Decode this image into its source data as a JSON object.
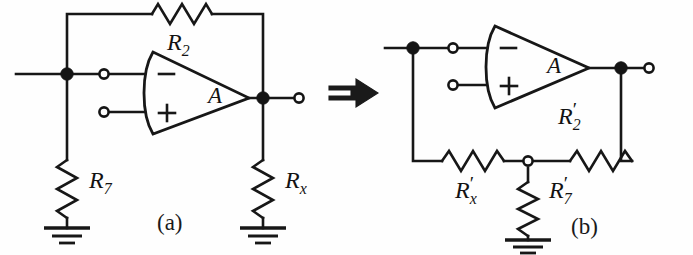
{
  "figure": {
    "caption_a": "(a)",
    "caption_b": "(b)",
    "transform_arrow": "double-right-arrow"
  },
  "circuit_a": {
    "name": "inverting-amplifier-with-rx-to-ground",
    "opamp": {
      "gain_label": "A",
      "inverting_input_symbol": "−",
      "noninverting_input_symbol": "+"
    },
    "components": [
      {
        "id": "R2",
        "base": "R",
        "subscript": "2",
        "prime": "",
        "orientation": "horizontal",
        "label": "R2"
      },
      {
        "id": "R7",
        "base": "R",
        "subscript": "7",
        "prime": "",
        "orientation": "vertical",
        "label": "R7"
      },
      {
        "id": "Rx",
        "base": "R",
        "subscript": "x",
        "prime": "",
        "orientation": "vertical",
        "label": "Rx"
      }
    ],
    "nodes": [
      {
        "id": "input-node",
        "type": "filled"
      },
      {
        "id": "output-node",
        "type": "filled"
      },
      {
        "id": "inverting-terminal",
        "type": "open"
      },
      {
        "id": "noninverting-terminal",
        "type": "open"
      },
      {
        "id": "output-terminal",
        "type": "open"
      }
    ],
    "grounds": [
      "ground-r7",
      "ground-rx"
    ]
  },
  "circuit_b": {
    "name": "equivalent-network-with-primed-resistors",
    "opamp": {
      "gain_label": "A",
      "inverting_input_symbol": "−",
      "noninverting_input_symbol": "+"
    },
    "components": [
      {
        "id": "R2p",
        "base": "R",
        "subscript": "2",
        "prime": "′",
        "orientation": "horizontal",
        "label": "R2'"
      },
      {
        "id": "Rxp",
        "base": "R",
        "subscript": "x",
        "prime": "′",
        "orientation": "horizontal",
        "label": "Rx'"
      },
      {
        "id": "R7p",
        "base": "R",
        "subscript": "7",
        "prime": "′",
        "orientation": "vertical",
        "label": "R7'"
      }
    ],
    "nodes": [
      {
        "id": "input-node",
        "type": "filled"
      },
      {
        "id": "output-node",
        "type": "filled"
      },
      {
        "id": "inverting-terminal",
        "type": "open"
      },
      {
        "id": "noninverting-terminal",
        "type": "open"
      },
      {
        "id": "output-terminal",
        "type": "open"
      },
      {
        "id": "divider-tap-node",
        "type": "open"
      }
    ],
    "grounds": [
      "ground-r7p"
    ]
  },
  "colors": {
    "ink": "#171717",
    "background": "#fefefe"
  }
}
